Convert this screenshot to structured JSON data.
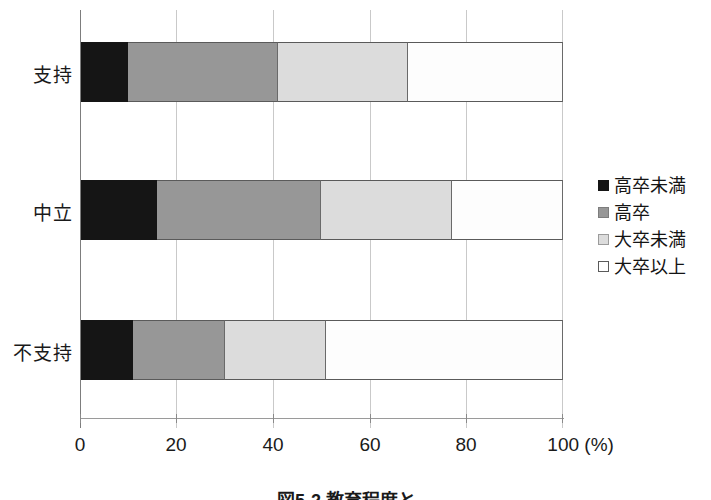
{
  "chart_data": {
    "type": "bar",
    "orientation": "horizontal",
    "stacked": true,
    "stack_mode": "percent",
    "title": "",
    "xlabel": "(%)",
    "ylabel": "",
    "xlim": [
      0,
      100
    ],
    "xticks": [
      0,
      20,
      40,
      60,
      80,
      100
    ],
    "xtick_labels": [
      "0",
      "20",
      "40",
      "60",
      "80",
      "100 (%)"
    ],
    "grid": "vertical",
    "legend_position": "right",
    "categories": [
      "支持",
      "中立",
      "不支持"
    ],
    "series": [
      {
        "name": "高卒未満",
        "color": "#151515",
        "values": [
          10,
          16,
          11
        ]
      },
      {
        "name": "高卒",
        "color": "#979797",
        "values": [
          31,
          34,
          19
        ]
      },
      {
        "name": "大卒未満",
        "color": "#dcdcdc",
        "values": [
          27,
          27,
          21
        ]
      },
      {
        "name": "大卒以上",
        "color": "#ffffff",
        "values": [
          32,
          23,
          49
        ]
      }
    ],
    "cumulative_boundaries": {
      "支持": [
        10,
        41,
        68,
        100
      ],
      "中立": [
        16,
        50,
        77,
        100
      ],
      "不支持": [
        11,
        30,
        51,
        100
      ]
    }
  },
  "axis": {
    "x_tick_labels": [
      "0",
      "20",
      "40",
      "60",
      "80",
      "100 (%)"
    ],
    "y_tick_labels": [
      "支持",
      "中立",
      "不支持"
    ],
    "unit_label": "(%)"
  },
  "legend": {
    "items": [
      {
        "label": "高卒未満",
        "color": "#151515"
      },
      {
        "label": "高卒",
        "color": "#979797"
      },
      {
        "label": "大卒未満",
        "color": "#dcdcdc"
      },
      {
        "label": "大卒以上",
        "color": "#ffffff"
      }
    ]
  },
  "caption": {
    "text": "図5-2 教育程度と…"
  }
}
